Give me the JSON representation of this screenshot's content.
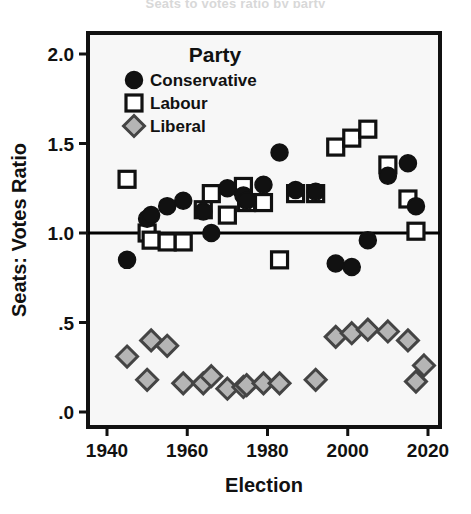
{
  "figure": {
    "cropped_title": "Seats to votes ratio by party",
    "background_color": "#ffffff"
  },
  "chart_data": {
    "type": "scatter",
    "title": "",
    "xlabel": "Election",
    "ylabel": "Seats: Votes Ratio",
    "xlim": [
      1936,
      2024
    ],
    "ylim": [
      0.0,
      2.1
    ],
    "grid": false,
    "reference_line": {
      "y": 1.0,
      "color": "#000000",
      "width": 3
    },
    "legend": {
      "title": "Party",
      "position": "top-left-inside",
      "entries": [
        {
          "name": "Conservative",
          "marker": "circle",
          "fill": "#111111",
          "stroke": "#111111"
        },
        {
          "name": "Labour",
          "marker": "square",
          "fill": "#ffffff",
          "stroke": "#111111"
        },
        {
          "name": "Liberal",
          "marker": "diamond",
          "fill": "#b5b5b5",
          "stroke": "#444444"
        }
      ]
    },
    "xticks": [
      1940,
      1960,
      1980,
      2000,
      2020
    ],
    "xtick_labels": [
      "1940",
      "1960",
      "1980",
      "2000",
      "2020"
    ],
    "yticks": [
      0.0,
      0.5,
      1.0,
      1.5,
      2.0
    ],
    "ytick_labels": [
      ".0",
      ".5",
      "1.0",
      "1.5",
      "2.0"
    ],
    "series": [
      {
        "name": "Conservative",
        "marker": "circle",
        "points": [
          {
            "x": 1945,
            "y": 0.85
          },
          {
            "x": 1950,
            "y": 1.08
          },
          {
            "x": 1951,
            "y": 1.1
          },
          {
            "x": 1955,
            "y": 1.15
          },
          {
            "x": 1959,
            "y": 1.18
          },
          {
            "x": 1964,
            "y": 1.12
          },
          {
            "x": 1966,
            "y": 1.0
          },
          {
            "x": 1970,
            "y": 1.25
          },
          {
            "x": 1974,
            "y": 1.21
          },
          {
            "x": 1974.8,
            "y": 1.18
          },
          {
            "x": 1979,
            "y": 1.27
          },
          {
            "x": 1983,
            "y": 1.45
          },
          {
            "x": 1987,
            "y": 1.24
          },
          {
            "x": 1992,
            "y": 1.23
          },
          {
            "x": 1997,
            "y": 0.83
          },
          {
            "x": 2001,
            "y": 0.81
          },
          {
            "x": 2005,
            "y": 0.96
          },
          {
            "x": 2010,
            "y": 1.32
          },
          {
            "x": 2015,
            "y": 1.39
          },
          {
            "x": 2017,
            "y": 1.15
          }
        ]
      },
      {
        "name": "Labour",
        "marker": "square",
        "points": [
          {
            "x": 1945,
            "y": 1.3
          },
          {
            "x": 1950,
            "y": 1.0
          },
          {
            "x": 1951,
            "y": 0.96
          },
          {
            "x": 1955,
            "y": 0.95
          },
          {
            "x": 1959,
            "y": 0.95
          },
          {
            "x": 1964,
            "y": 1.13
          },
          {
            "x": 1966,
            "y": 1.22
          },
          {
            "x": 1970,
            "y": 1.1
          },
          {
            "x": 1974,
            "y": 1.26
          },
          {
            "x": 1974.8,
            "y": 1.17
          },
          {
            "x": 1979,
            "y": 1.17
          },
          {
            "x": 1983,
            "y": 0.85
          },
          {
            "x": 1987,
            "y": 1.22
          },
          {
            "x": 1992,
            "y": 1.22
          },
          {
            "x": 1997,
            "y": 1.48
          },
          {
            "x": 2001,
            "y": 1.53
          },
          {
            "x": 2005,
            "y": 1.58
          },
          {
            "x": 2010,
            "y": 1.38
          },
          {
            "x": 2015,
            "y": 1.19
          },
          {
            "x": 2017,
            "y": 1.01
          }
        ]
      },
      {
        "name": "Liberal",
        "marker": "diamond",
        "points": [
          {
            "x": 1945,
            "y": 0.31
          },
          {
            "x": 1950,
            "y": 0.18
          },
          {
            "x": 1951,
            "y": 0.4
          },
          {
            "x": 1955,
            "y": 0.37
          },
          {
            "x": 1959,
            "y": 0.16
          },
          {
            "x": 1964,
            "y": 0.16
          },
          {
            "x": 1966,
            "y": 0.2
          },
          {
            "x": 1970,
            "y": 0.13
          },
          {
            "x": 1974,
            "y": 0.14
          },
          {
            "x": 1974.8,
            "y": 0.15
          },
          {
            "x": 1979,
            "y": 0.16
          },
          {
            "x": 1983,
            "y": 0.16
          },
          {
            "x": 1992,
            "y": 0.18
          },
          {
            "x": 1997,
            "y": 0.42
          },
          {
            "x": 2001,
            "y": 0.44
          },
          {
            "x": 2005,
            "y": 0.46
          },
          {
            "x": 2010,
            "y": 0.45
          },
          {
            "x": 2015,
            "y": 0.4
          },
          {
            "x": 2017,
            "y": 0.17
          },
          {
            "x": 2019,
            "y": 0.26
          }
        ]
      }
    ]
  }
}
